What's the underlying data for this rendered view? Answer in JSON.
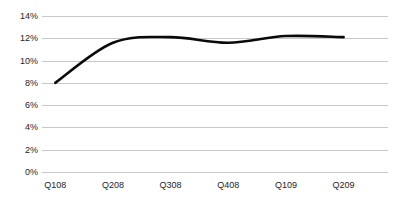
{
  "chart_data": {
    "type": "line",
    "title": "",
    "subtitle": "",
    "xlabel": "",
    "ylabel": "",
    "categories": [
      "Q108",
      "Q208",
      "Q308",
      "Q408",
      "Q109",
      "Q209"
    ],
    "series": [
      {
        "name": "",
        "values": [
          8.0,
          11.6,
          12.1,
          11.6,
          12.2,
          12.1
        ],
        "color": "#0a0a0a",
        "smooth": true
      }
    ],
    "ylim": [
      0,
      14
    ],
    "ytick_values": [
      0,
      2,
      4,
      6,
      8,
      10,
      12,
      14
    ],
    "ytick_labels": [
      "0%",
      "2%",
      "4%",
      "6%",
      "8%",
      "10%",
      "12%",
      "14%"
    ],
    "grid": {
      "horizontal": true,
      "vertical": false,
      "color": "#c9c9c9"
    },
    "legend": {
      "visible": false,
      "position": "none",
      "entries": []
    },
    "annotations": [],
    "background_color": "#ffffff",
    "axis_label_color": "#252525"
  }
}
